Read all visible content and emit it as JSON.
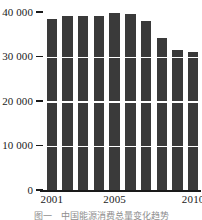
{
  "chart_data": {
    "type": "bar",
    "title": "",
    "xlabel": "",
    "ylabel": "",
    "categories": [
      "2001",
      "2002",
      "2003",
      "2004",
      "2005",
      "2006",
      "2007",
      "2008",
      "2009",
      "2010"
    ],
    "values": [
      38500,
      39000,
      39000,
      39000,
      39700,
      39500,
      38000,
      34200,
      31500,
      31000
    ],
    "ylim": [
      0,
      40000
    ],
    "grid": true,
    "legend": null,
    "bar_color": "#3a3a3a",
    "gridline_color": "#ffffff",
    "axis_color": "#1a1a1a"
  },
  "axes": {
    "y_ticks": [
      {
        "label": "40 000",
        "value": 40000
      },
      {
        "label": "30 000",
        "value": 30000
      },
      {
        "label": "20 000",
        "value": 20000
      },
      {
        "label": "10 000",
        "value": 10000
      },
      {
        "label": "0",
        "value": 0
      }
    ],
    "x_ticks": [
      {
        "label": "2001",
        "index": 0
      },
      {
        "label": "2005",
        "index": 4
      },
      {
        "label": "2010",
        "index": 9
      }
    ]
  },
  "caption": {
    "text": "图一　中国能源消费总量变化趋势"
  }
}
